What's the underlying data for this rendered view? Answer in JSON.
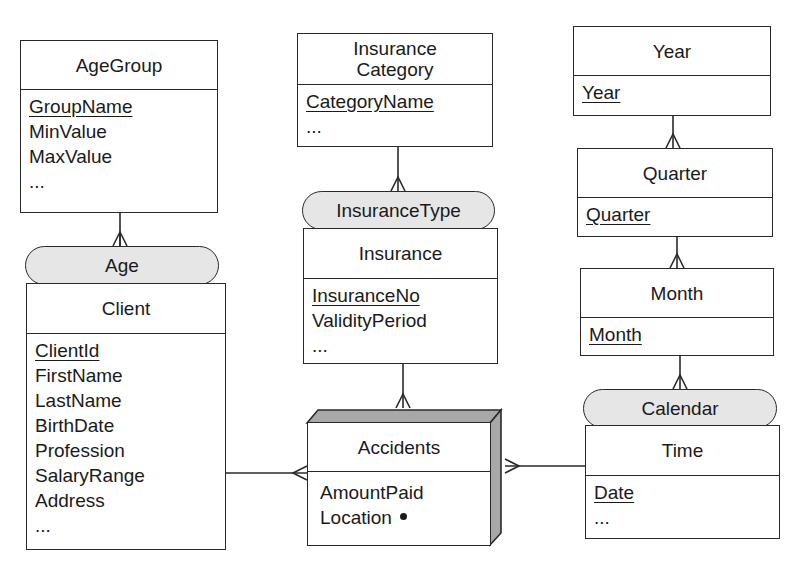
{
  "diagram": {
    "type": "multidimensional-er",
    "levels": [
      {
        "id": "agegroup",
        "name": "AgeGroup",
        "attributes": [
          {
            "label": "GroupName",
            "key": true
          },
          {
            "label": "MinValue",
            "key": false
          },
          {
            "label": "MaxValue",
            "key": false
          },
          {
            "label": "...",
            "key": false
          }
        ]
      },
      {
        "id": "client",
        "name": "Client",
        "attributes": [
          {
            "label": "ClientId",
            "key": true
          },
          {
            "label": "FirstName",
            "key": false
          },
          {
            "label": "LastName",
            "key": false
          },
          {
            "label": "BirthDate",
            "key": false
          },
          {
            "label": "Profession",
            "key": false
          },
          {
            "label": "SalaryRange",
            "key": false
          },
          {
            "label": "Address",
            "key": false
          },
          {
            "label": "...",
            "key": false
          }
        ]
      },
      {
        "id": "insurancecategory",
        "name": "Insurance Category",
        "name_lines": [
          "Insurance",
          "Category"
        ],
        "attributes": [
          {
            "label": "CategoryName",
            "key": true
          },
          {
            "label": "...",
            "key": false
          }
        ]
      },
      {
        "id": "insurance",
        "name": "Insurance",
        "attributes": [
          {
            "label": "InsuranceNo",
            "key": true
          },
          {
            "label": "ValidityPeriod",
            "key": false
          },
          {
            "label": "...",
            "key": false
          }
        ]
      },
      {
        "id": "year",
        "name": "Year",
        "attributes": [
          {
            "label": "Year",
            "key": true
          }
        ]
      },
      {
        "id": "quarter",
        "name": "Quarter",
        "attributes": [
          {
            "label": "Quarter",
            "key": true
          }
        ]
      },
      {
        "id": "month",
        "name": "Month",
        "attributes": [
          {
            "label": "Month",
            "key": true
          }
        ]
      },
      {
        "id": "time",
        "name": "Time",
        "attributes": [
          {
            "label": "Date",
            "key": true
          },
          {
            "label": "...",
            "key": false
          }
        ]
      }
    ],
    "fact": {
      "id": "accidents",
      "name": "Accidents",
      "measures": [
        {
          "label": "AmountPaid",
          "marker": null
        },
        {
          "label": "Location",
          "marker": "bullet"
        }
      ]
    },
    "hierarchies": [
      {
        "label": "Age",
        "child": "client",
        "parent": "agegroup"
      },
      {
        "label": "InsuranceType",
        "child": "insurance",
        "parent": "insurancecategory"
      },
      {
        "label": "Calendar",
        "child": "time",
        "parent": "month"
      }
    ],
    "parent_child_links": [
      {
        "child": "quarter",
        "parent": "year"
      },
      {
        "child": "month",
        "parent": "quarter"
      }
    ],
    "fact_links": [
      {
        "from": "accidents",
        "to": "client"
      },
      {
        "from": "accidents",
        "to": "insurance"
      },
      {
        "from": "accidents",
        "to": "time"
      }
    ],
    "colors": {
      "line": "#2a2a2a",
      "pill_fill": "#e6e6e6",
      "fact_shade": "#a8a8a8",
      "background": "#ffffff"
    }
  }
}
